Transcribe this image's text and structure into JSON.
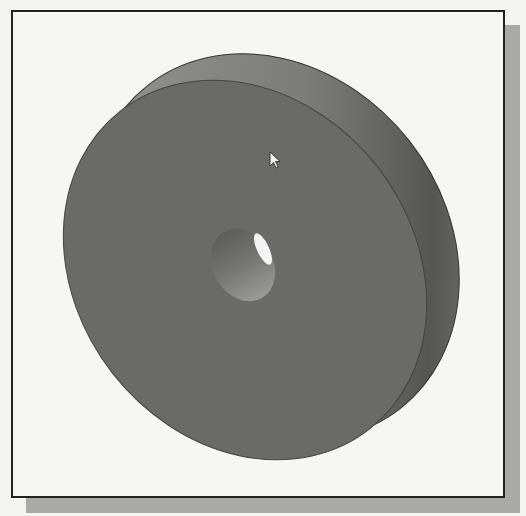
{
  "figure": {
    "colors": {
      "background": "#f6f6f4",
      "frame_border": "#222222",
      "shadow": "#a9a9a7",
      "front_face": "#6a6a68",
      "rim": "#8e8e8c",
      "rim_dark": "#575755",
      "hole_inner": "#8a8a88",
      "hole_highlight": "#f4f4f4"
    },
    "cursor": {
      "icon": "arrow-cursor-icon",
      "x": 268,
      "y": 150
    }
  }
}
